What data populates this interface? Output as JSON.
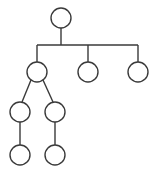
{
  "diagram": {
    "type": "tree",
    "stroke_color": "#3a3a3a",
    "background": "#ffffff",
    "node_radius": 10,
    "nodes": [
      {
        "id": "root",
        "label": "",
        "x": 61,
        "y": 18
      },
      {
        "id": "a",
        "label": "",
        "x": 37,
        "y": 72
      },
      {
        "id": "b",
        "label": "",
        "x": 88,
        "y": 72
      },
      {
        "id": "c",
        "label": "",
        "x": 138,
        "y": 72
      },
      {
        "id": "a1",
        "label": "",
        "x": 20,
        "y": 112
      },
      {
        "id": "a2",
        "label": "",
        "x": 55,
        "y": 112
      },
      {
        "id": "a1x",
        "label": "",
        "x": 20,
        "y": 155
      },
      {
        "id": "a2x",
        "label": "",
        "x": 55,
        "y": 155
      }
    ],
    "edges": [
      {
        "from": "root",
        "to": "a"
      },
      {
        "from": "root",
        "to": "b"
      },
      {
        "from": "root",
        "to": "c"
      },
      {
        "from": "a",
        "to": "a1"
      },
      {
        "from": "a",
        "to": "a2"
      },
      {
        "from": "a1",
        "to": "a1x"
      },
      {
        "from": "a2",
        "to": "a2x"
      }
    ]
  }
}
